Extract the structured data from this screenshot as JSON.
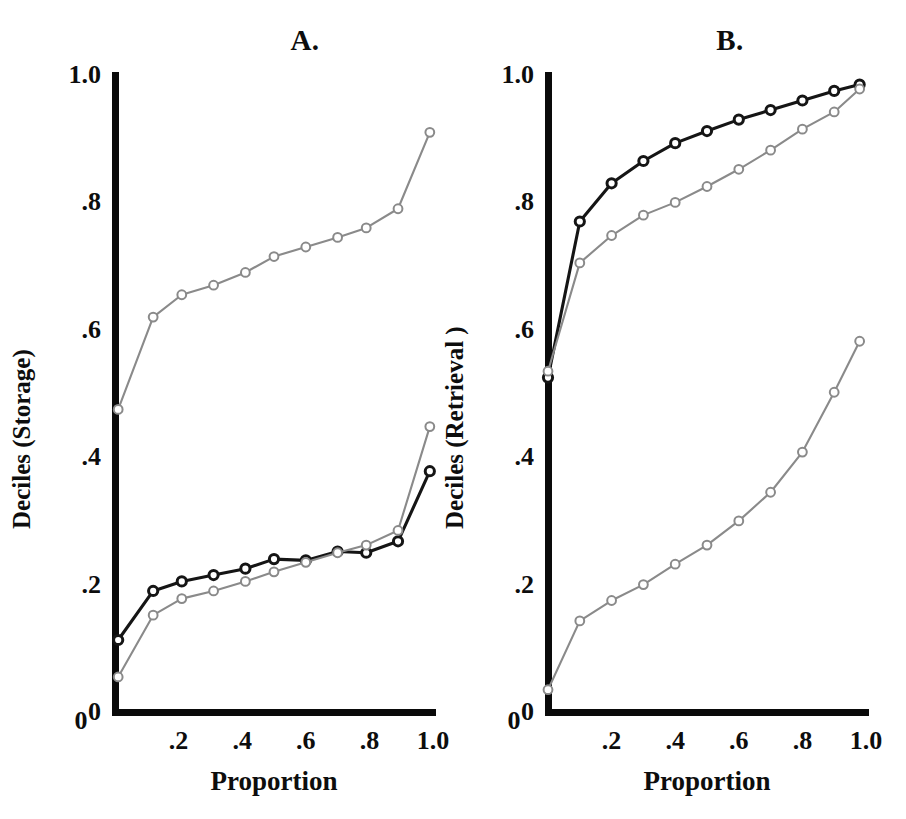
{
  "figure": {
    "width": 906,
    "height": 819,
    "background": "#ffffff"
  },
  "colors": {
    "axis": "#0a0a0a",
    "black_series": "#151515",
    "gray_series": "#8a8a8a",
    "marker_fill": "#ffffff",
    "text": "#0d0d0d"
  },
  "panels": {
    "a": {
      "title": "A.",
      "ylabel": "Deciles (Storage)",
      "xlabel": "Proportion",
      "yticks": [
        "0",
        ".2",
        ".4",
        ".6",
        ".8",
        "1.0"
      ],
      "xticks": [
        "0",
        ".2",
        ".4",
        ".6",
        ".8",
        "1.0"
      ]
    },
    "b": {
      "title": "B.",
      "ylabel": "Deciles (Retrieval )",
      "xlabel": "Proportion",
      "yticks": [
        "0",
        ".2",
        ".4",
        ".6",
        ".8",
        "1.0"
      ],
      "xticks": [
        "0",
        ".2",
        ".4",
        ".6",
        ".8",
        "1.0"
      ]
    }
  },
  "chart_data": [
    {
      "type": "line",
      "panel": "A",
      "title": "A.",
      "xlabel": "Proportion",
      "ylabel": "Deciles (Storage)",
      "xlim": [
        0,
        1.0
      ],
      "ylim": [
        0,
        1.0
      ],
      "xticks": [
        0,
        0.2,
        0.4,
        0.6,
        0.8,
        1.0
      ],
      "yticks": [
        0,
        0.2,
        0.4,
        0.6,
        0.8,
        1.0
      ],
      "grid": false,
      "legend": "none",
      "marker": "open-circle",
      "series": [
        {
          "name": "upper-gray",
          "color": "#8a8a8a",
          "x": [
            0.01,
            0.12,
            0.21,
            0.31,
            0.41,
            0.5,
            0.6,
            0.7,
            0.79,
            0.89,
            0.99
          ],
          "y": [
            0.475,
            0.62,
            0.655,
            0.67,
            0.69,
            0.715,
            0.73,
            0.745,
            0.76,
            0.79,
            0.91
          ]
        },
        {
          "name": "lower-black",
          "color": "#151515",
          "x": [
            0.01,
            0.12,
            0.21,
            0.31,
            0.41,
            0.5,
            0.6,
            0.7,
            0.79,
            0.89,
            0.99
          ],
          "y": [
            0.113,
            0.19,
            0.205,
            0.215,
            0.225,
            0.24,
            0.238,
            0.252,
            0.25,
            0.268,
            0.378
          ]
        },
        {
          "name": "lower-gray",
          "color": "#8a8a8a",
          "x": [
            0.01,
            0.12,
            0.21,
            0.31,
            0.41,
            0.5,
            0.6,
            0.7,
            0.79,
            0.89,
            0.99
          ],
          "y": [
            0.055,
            0.152,
            0.178,
            0.19,
            0.205,
            0.22,
            0.235,
            0.25,
            0.262,
            0.285,
            0.448
          ]
        }
      ]
    },
    {
      "type": "line",
      "panel": "B",
      "title": "B.",
      "xlabel": "Proportion",
      "ylabel": "Deciles (Retrieval )",
      "xlim": [
        0,
        1.0
      ],
      "ylim": [
        0,
        1.0
      ],
      "xticks": [
        0,
        0.2,
        0.4,
        0.6,
        0.8,
        1.0
      ],
      "yticks": [
        0,
        0.2,
        0.4,
        0.6,
        0.8,
        1.0
      ],
      "grid": false,
      "legend": "none",
      "marker": "open-circle",
      "series": [
        {
          "name": "upper-black",
          "color": "#151515",
          "x": [
            0.0,
            0.1,
            0.2,
            0.3,
            0.4,
            0.5,
            0.6,
            0.7,
            0.8,
            0.9,
            0.98
          ],
          "y": [
            0.525,
            0.77,
            0.83,
            0.865,
            0.893,
            0.912,
            0.93,
            0.945,
            0.96,
            0.975,
            0.985
          ]
        },
        {
          "name": "middle-gray",
          "color": "#8a8a8a",
          "x": [
            0.0,
            0.1,
            0.2,
            0.3,
            0.4,
            0.5,
            0.6,
            0.7,
            0.8,
            0.9,
            0.98
          ],
          "y": [
            0.535,
            0.705,
            0.748,
            0.78,
            0.8,
            0.825,
            0.852,
            0.882,
            0.915,
            0.942,
            0.978
          ]
        },
        {
          "name": "lower-gray",
          "color": "#8a8a8a",
          "x": [
            0.0,
            0.1,
            0.2,
            0.3,
            0.4,
            0.5,
            0.6,
            0.7,
            0.8,
            0.9,
            0.98
          ],
          "y": [
            0.035,
            0.143,
            0.175,
            0.2,
            0.232,
            0.262,
            0.3,
            0.345,
            0.408,
            0.502,
            0.582
          ]
        }
      ]
    }
  ]
}
